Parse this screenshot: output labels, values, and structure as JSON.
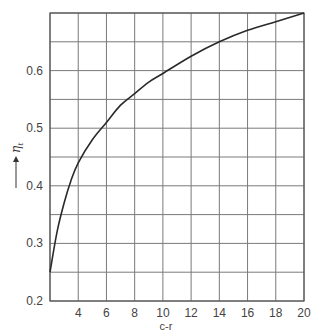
{
  "chart_data": {
    "type": "line",
    "title": "",
    "xlabel": "c-r",
    "ylabel": "η_t",
    "ylabel_symbol": "η",
    "ylabel_subscript": "t",
    "xlim": [
      2,
      20
    ],
    "ylim": [
      0.2,
      0.7
    ],
    "x_ticks": [
      4,
      6,
      8,
      10,
      12,
      14,
      16,
      18,
      20
    ],
    "x_tick_labels": [
      "4",
      "6",
      "8",
      "10",
      "12",
      "14",
      "16",
      "18",
      "20"
    ],
    "y_ticks": [
      0.2,
      0.3,
      0.4,
      0.5,
      0.6
    ],
    "y_tick_labels": [
      "0.2",
      "0.3",
      "0.4",
      "0.5",
      "0.6"
    ],
    "grid": true,
    "x_grid": [
      2,
      4,
      6,
      8,
      10,
      12,
      14,
      16,
      18,
      20
    ],
    "y_grid": [
      0.2,
      0.25,
      0.3,
      0.35,
      0.4,
      0.45,
      0.5,
      0.55,
      0.6,
      0.65,
      0.7
    ],
    "legend": null,
    "series": [
      {
        "name": "η_t",
        "x": [
          2,
          2.5,
          3,
          3.5,
          4,
          5,
          6,
          7,
          8,
          9,
          10,
          12,
          14,
          16,
          18,
          20
        ],
        "y": [
          0.25,
          0.32,
          0.37,
          0.41,
          0.44,
          0.48,
          0.51,
          0.54,
          0.56,
          0.58,
          0.595,
          0.625,
          0.65,
          0.67,
          0.685,
          0.7
        ]
      }
    ]
  },
  "colors": {
    "grid": "#7a7a7a",
    "curve": "#2a2a2a",
    "text": "#444444"
  }
}
